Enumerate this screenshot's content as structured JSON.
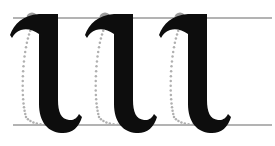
{
  "figure": {
    "canvas": {
      "width": 275,
      "height": 146
    },
    "colors": {
      "background": "#ffffff",
      "stroke_fill": "#0d0d0d",
      "guideline": "#9a9a9a",
      "start_dot": "#9b9b9b",
      "dotted_path": "#b0b0b0",
      "arrowhead": "#a5a5a5"
    }
  },
  "guidelines": {
    "name": "writing-guidelines",
    "count": 2,
    "x_start": 13,
    "x_end": 272,
    "thickness": 1.6,
    "lines": [
      {
        "label": "x-height-line",
        "y": 18
      },
      {
        "label": "baseline",
        "y": 125
      }
    ]
  },
  "letters": {
    "glyph": "l",
    "script": "blackletter",
    "count": 3,
    "items": [
      {
        "index": 1,
        "label": "minim-stroke-1",
        "offset_x": 0
      },
      {
        "index": 2,
        "label": "minim-stroke-2",
        "offset_x": 75
      },
      {
        "index": 3,
        "label": "minim-stroke-3",
        "offset_x": 149
      }
    ]
  },
  "annotations": {
    "label": "stroke-direction-guides",
    "count": 3,
    "start_dot_radius": 5.6,
    "dot_spacing": 3.9,
    "dot_radius": 1.25,
    "arrow_direction": "left",
    "items": [
      {
        "index": 1,
        "label": "stroke-guide-1",
        "dot_x": 32,
        "dot_y": 18,
        "arrow_x": 62,
        "arrow_y": 125
      },
      {
        "index": 2,
        "label": "stroke-guide-2",
        "dot_x": 105,
        "dot_y": 18,
        "arrow_x": 135,
        "arrow_y": 125
      },
      {
        "index": 3,
        "label": "stroke-guide-3",
        "dot_x": 180,
        "dot_y": 18,
        "arrow_x": 210,
        "arrow_y": 125
      }
    ]
  }
}
